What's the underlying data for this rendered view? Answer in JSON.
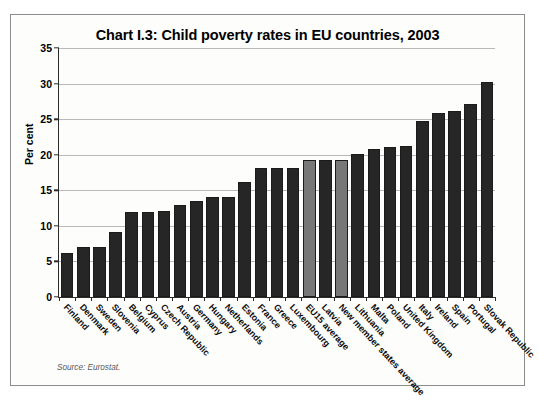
{
  "figure": {
    "title": "Chart I.3: Child poverty rates in EU countries, 2003",
    "source": "Source: Eurostat.",
    "bar_color": "#262626",
    "highlight_color": "#777777"
  },
  "chart_data": {
    "type": "bar",
    "title": "Chart I.3: Child poverty rates in EU countries, 2003",
    "xlabel": "",
    "ylabel": "Per cent",
    "ylim": [
      0,
      35
    ],
    "yticks": [
      0,
      5,
      10,
      15,
      20,
      25,
      30,
      35
    ],
    "grid": true,
    "legend": null,
    "categories": [
      "Finland",
      "Denmark",
      "Sweden",
      "Slovenia",
      "Belgium",
      "Cyprus",
      "Czech Republic",
      "Austria",
      "Germany",
      "Hungary",
      "Netherlands",
      "Estonia",
      "France",
      "Greece",
      "Luxembourg",
      "EU15 average",
      "Latvia",
      "New member states average",
      "Lithuania",
      "Malta",
      "Poland",
      "United Kingdom",
      "Italy",
      "Ireland",
      "Spain",
      "Portugal",
      "Slovak Republic"
    ],
    "values": [
      6.2,
      7.0,
      7.1,
      9.2,
      12.0,
      12.0,
      12.1,
      12.9,
      13.5,
      14.0,
      14.1,
      16.2,
      18.2,
      18.2,
      18.2,
      19.2,
      19.2,
      19.3,
      20.1,
      20.8,
      21.1,
      21.2,
      24.8,
      25.8,
      26.2,
      27.1,
      30.2
    ],
    "highlighted": [
      "EU15 average",
      "New member states average"
    ],
    "annotations": [
      "Source: Eurostat."
    ]
  }
}
